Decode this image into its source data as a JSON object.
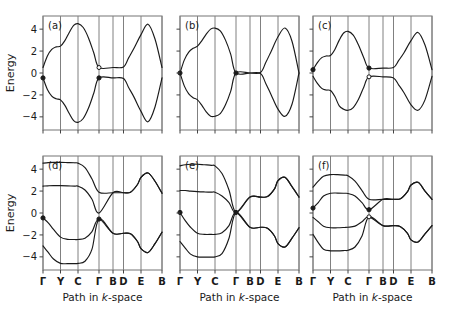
{
  "figure": {
    "type": "electronic band structure multi-panel figure",
    "panels_rows": 2,
    "panels_cols": 3,
    "background": "#ffffff",
    "line_color": "#1a1a1a",
    "grid_color": "#808080"
  },
  "axes": {
    "ylabel": "Energy",
    "xlabel_prefix": "Path in ",
    "xlabel_italic": "k",
    "xlabel_suffix": "-space",
    "xlabel_full": "Path in k-space",
    "yticks": [
      4,
      2,
      0,
      -2,
      -4
    ],
    "ytick_labels": [
      "4",
      "2",
      "0",
      "−2",
      "−4"
    ],
    "ylim": [
      -5.2,
      5.2
    ],
    "xtick_labels": [
      "Γ",
      "Y",
      "C",
      "Γ",
      "B",
      "D",
      "E",
      "B"
    ],
    "xtick_positions": [
      0,
      1,
      2,
      3.2,
      4.0,
      4.6,
      5.6,
      6.8
    ],
    "xlim": [
      0,
      6.8
    ]
  },
  "chart_data": {
    "type": "line",
    "title": "",
    "xlabel": "Path in k-space",
    "ylabel": "Energy",
    "ylim": [
      -5.2,
      5.2
    ],
    "grid": "vertical gridlines at each k-point label",
    "legend": "none",
    "panels": [
      {
        "tag": "(a)",
        "n_bands": 2,
        "gap_at_second_gamma": true,
        "markers": [
          {
            "x": 0.0,
            "y": -0.45,
            "style": "filled"
          },
          {
            "x": 3.2,
            "y": -0.45,
            "style": "filled"
          },
          {
            "x": 3.2,
            "y": 0.5,
            "style": "open"
          }
        ],
        "series": [
          {
            "name": "band-upper",
            "x": [
              0.0,
              0.25,
              0.5,
              0.75,
              1.0,
              1.25,
              1.5,
              1.75,
              2.0,
              2.3,
              2.6,
              2.9,
              3.2,
              4.0,
              4.6,
              4.9,
              5.2,
              5.6,
              6.0,
              6.4,
              6.8
            ],
            "y": [
              0.5,
              1.55,
              2.15,
              2.38,
              2.45,
              2.95,
              3.7,
              4.35,
              4.5,
              4.15,
              3.2,
              1.85,
              0.5,
              0.5,
              0.55,
              1.4,
              2.25,
              3.5,
              4.45,
              3.1,
              0.5
            ]
          },
          {
            "name": "band-lower",
            "x": [
              0.0,
              0.25,
              0.5,
              0.75,
              1.0,
              1.25,
              1.5,
              1.75,
              2.0,
              2.3,
              2.6,
              2.9,
              3.2,
              4.0,
              4.6,
              4.9,
              5.2,
              5.6,
              6.0,
              6.4,
              6.8
            ],
            "y": [
              -0.45,
              -1.5,
              -2.1,
              -2.35,
              -2.45,
              -2.95,
              -3.7,
              -4.35,
              -4.5,
              -4.15,
              -3.2,
              -1.85,
              -0.45,
              -0.45,
              -0.5,
              -1.35,
              -2.2,
              -3.5,
              -4.45,
              -3.1,
              -0.45
            ]
          }
        ]
      },
      {
        "tag": "(b)",
        "n_bands": 2,
        "gap_at_second_gamma": false,
        "markers": [
          {
            "x": 0.0,
            "y": 0.0,
            "style": "filled"
          },
          {
            "x": 3.2,
            "y": 0.0,
            "style": "filled"
          }
        ],
        "series": [
          {
            "name": "band-upper",
            "x": [
              0.0,
              0.25,
              0.5,
              0.75,
              1.0,
              1.25,
              1.5,
              1.75,
              2.0,
              2.3,
              2.6,
              2.9,
              3.2,
              4.0,
              4.6,
              4.9,
              5.2,
              5.6,
              6.0,
              6.4,
              6.8
            ],
            "y": [
              0.0,
              1.2,
              1.9,
              2.25,
              2.45,
              2.95,
              3.55,
              4.0,
              4.1,
              3.85,
              3.0,
              1.7,
              0.0,
              0.0,
              0.05,
              0.95,
              1.95,
              3.3,
              4.1,
              2.9,
              0.0
            ]
          },
          {
            "name": "band-lower",
            "x": [
              0.0,
              0.25,
              0.5,
              0.75,
              1.0,
              1.25,
              1.5,
              1.75,
              2.0,
              2.3,
              2.6,
              2.9,
              3.2,
              4.0,
              4.6,
              4.9,
              5.2,
              5.6,
              6.0,
              6.4,
              6.8
            ],
            "y": [
              0.0,
              -1.2,
              -1.9,
              -2.25,
              -2.45,
              -2.95,
              -3.55,
              -3.95,
              -3.95,
              -3.7,
              -2.9,
              -1.65,
              0.0,
              0.0,
              -0.05,
              -0.95,
              -1.95,
              -3.3,
              -3.95,
              -2.85,
              0.0
            ]
          }
        ]
      },
      {
        "tag": "(c)",
        "n_bands": 2,
        "gap_at_second_gamma": true,
        "markers": [
          {
            "x": 0.0,
            "y": 0.3,
            "style": "filled"
          },
          {
            "x": 3.2,
            "y": 0.45,
            "style": "filled"
          },
          {
            "x": 3.2,
            "y": -0.35,
            "style": "open"
          }
        ],
        "series": [
          {
            "name": "band-upper",
            "x": [
              0.0,
              0.25,
              0.5,
              0.75,
              1.0,
              1.25,
              1.5,
              1.75,
              2.0,
              2.3,
              2.6,
              2.9,
              3.2,
              4.0,
              4.6,
              4.9,
              5.2,
              5.6,
              6.0,
              6.4,
              6.8
            ],
            "y": [
              0.3,
              0.95,
              1.4,
              1.55,
              1.6,
              2.15,
              3.0,
              3.65,
              3.8,
              3.45,
              2.55,
              1.4,
              0.45,
              0.45,
              0.5,
              1.15,
              1.85,
              2.95,
              3.7,
              2.55,
              0.3
            ]
          },
          {
            "name": "band-lower",
            "x": [
              0.0,
              0.25,
              0.5,
              0.75,
              1.0,
              1.25,
              1.5,
              1.75,
              2.0,
              2.3,
              2.6,
              2.9,
              3.2,
              4.0,
              4.6,
              4.9,
              5.2,
              5.6,
              6.0,
              6.4,
              6.8
            ],
            "y": [
              -0.3,
              -0.95,
              -1.4,
              -1.55,
              -1.6,
              -2.15,
              -3.0,
              -3.3,
              -3.4,
              -3.15,
              -2.4,
              -1.3,
              -0.35,
              -0.35,
              -0.45,
              -1.1,
              -1.8,
              -2.9,
              -3.4,
              -2.45,
              -0.3
            ]
          }
        ]
      },
      {
        "tag": "(d)",
        "n_bands": 4,
        "gap_at_second_gamma": true,
        "markers": [
          {
            "x": 0.0,
            "y": -0.45,
            "style": "filled"
          },
          {
            "x": 3.2,
            "y": -0.55,
            "style": "filled"
          }
        ],
        "series": [
          {
            "name": "band-1",
            "x": [
              0.0,
              0.3,
              0.6,
              1.0,
              1.4,
              1.8,
              2.0,
              2.4,
              2.8,
              3.2,
              4.0,
              4.6,
              5.0,
              5.4,
              5.6,
              6.0,
              6.4,
              6.8
            ],
            "y": [
              4.55,
              4.6,
              4.62,
              4.62,
              4.6,
              4.58,
              4.55,
              4.15,
              3.1,
              1.9,
              1.85,
              1.85,
              1.9,
              2.6,
              3.25,
              3.65,
              2.9,
              1.8
            ]
          },
          {
            "name": "band-2",
            "x": [
              0.0,
              0.3,
              0.6,
              1.0,
              1.4,
              1.8,
              2.0,
              2.4,
              2.8,
              3.2,
              4.0,
              4.6,
              5.0,
              5.4,
              5.6,
              6.0,
              6.4,
              6.8
            ],
            "y": [
              2.45,
              2.48,
              2.5,
              2.5,
              2.48,
              2.45,
              2.45,
              2.1,
              1.25,
              0.0,
              1.85,
              1.85,
              1.9,
              2.6,
              3.25,
              3.65,
              2.9,
              1.8
            ]
          },
          {
            "name": "band-3",
            "x": [
              0.0,
              0.3,
              0.6,
              1.0,
              1.4,
              1.8,
              2.0,
              2.4,
              2.8,
              3.2,
              4.0,
              4.6,
              5.0,
              5.4,
              5.6,
              6.0,
              6.4,
              6.8
            ],
            "y": [
              -0.45,
              -0.9,
              -1.5,
              -2.2,
              -2.4,
              -2.42,
              -2.42,
              -2.3,
              -1.7,
              -0.55,
              -1.85,
              -1.85,
              -1.9,
              -2.6,
              -3.25,
              -3.6,
              -2.8,
              -1.75
            ]
          },
          {
            "name": "band-4",
            "x": [
              0.0,
              0.3,
              0.6,
              1.0,
              1.4,
              1.8,
              2.0,
              2.4,
              2.8,
              3.2,
              4.0,
              4.6,
              5.0,
              5.4,
              5.6,
              6.0,
              6.4,
              6.8
            ],
            "y": [
              -3.0,
              -3.6,
              -4.2,
              -4.6,
              -4.62,
              -4.62,
              -4.6,
              -4.4,
              -3.3,
              -0.55,
              -1.85,
              -1.85,
              -1.9,
              -2.6,
              -3.25,
              -3.6,
              -2.8,
              -1.75
            ]
          }
        ]
      },
      {
        "tag": "(e)",
        "n_bands": 4,
        "gap_at_second_gamma": true,
        "markers": [
          {
            "x": 0.0,
            "y": 0.05,
            "style": "filled"
          },
          {
            "x": 3.2,
            "y": 0.05,
            "style": "filled"
          }
        ],
        "series": [
          {
            "name": "band-1",
            "x": [
              0.0,
              0.3,
              0.6,
              1.0,
              1.4,
              1.8,
              2.0,
              2.4,
              2.8,
              3.2,
              4.0,
              4.6,
              5.0,
              5.4,
              5.6,
              6.0,
              6.4,
              6.8
            ],
            "y": [
              4.3,
              4.4,
              4.45,
              4.45,
              4.4,
              4.35,
              4.3,
              3.6,
              2.1,
              0.05,
              1.45,
              1.45,
              1.5,
              2.2,
              2.95,
              3.25,
              2.4,
              1.45
            ]
          },
          {
            "name": "band-2",
            "x": [
              0.0,
              0.3,
              0.6,
              1.0,
              1.4,
              1.8,
              2.0,
              2.4,
              2.8,
              3.2,
              4.0,
              4.6,
              5.0,
              5.4,
              5.6,
              6.0,
              6.4,
              6.8
            ],
            "y": [
              2.05,
              2.05,
              2.0,
              1.95,
              1.92,
              1.9,
              1.9,
              1.55,
              0.95,
              0.05,
              1.45,
              1.45,
              1.5,
              2.2,
              2.95,
              3.25,
              2.4,
              1.45
            ]
          },
          {
            "name": "band-3",
            "x": [
              0.0,
              0.3,
              0.6,
              1.0,
              1.4,
              1.8,
              2.0,
              2.4,
              2.8,
              3.2,
              4.0,
              4.6,
              5.0,
              5.4,
              5.6,
              6.0,
              6.4,
              6.8
            ],
            "y": [
              0.05,
              -0.7,
              -1.3,
              -1.85,
              -1.95,
              -1.95,
              -1.95,
              -1.8,
              -1.15,
              0.05,
              -1.3,
              -1.3,
              -1.4,
              -2.1,
              -2.8,
              -3.1,
              -2.3,
              -1.35
            ]
          },
          {
            "name": "band-4",
            "x": [
              0.0,
              0.3,
              0.6,
              1.0,
              1.4,
              1.8,
              2.0,
              2.4,
              2.8,
              3.2,
              4.0,
              4.6,
              5.0,
              5.4,
              5.6,
              6.0,
              6.4,
              6.8
            ],
            "y": [
              -2.6,
              -3.2,
              -3.75,
              -4.0,
              -4.02,
              -4.02,
              -4.0,
              -3.7,
              -2.3,
              0.05,
              -1.3,
              -1.3,
              -1.4,
              -2.1,
              -2.8,
              -3.1,
              -2.3,
              -1.35
            ]
          }
        ]
      },
      {
        "tag": "(f)",
        "n_bands": 4,
        "gap_at_second_gamma": true,
        "markers": [
          {
            "x": 0.0,
            "y": 0.45,
            "style": "filled"
          },
          {
            "x": 3.2,
            "y": 0.3,
            "style": "filled"
          },
          {
            "x": 3.2,
            "y": -0.35,
            "style": "open"
          }
        ],
        "series": [
          {
            "name": "band-1",
            "x": [
              0.0,
              0.3,
              0.6,
              1.0,
              1.4,
              1.8,
              2.0,
              2.4,
              2.8,
              3.2,
              4.0,
              4.6,
              5.0,
              5.4,
              5.6,
              6.0,
              6.4,
              6.8
            ],
            "y": [
              2.35,
              2.9,
              3.35,
              3.5,
              3.5,
              3.45,
              3.4,
              2.9,
              2.05,
              1.25,
              1.25,
              1.25,
              1.3,
              1.95,
              2.55,
              2.8,
              2.0,
              1.25
            ]
          },
          {
            "name": "band-2",
            "x": [
              0.0,
              0.3,
              0.6,
              1.0,
              1.4,
              1.8,
              2.0,
              2.4,
              2.8,
              3.2,
              4.0,
              4.6,
              5.0,
              5.4,
              5.6,
              6.0,
              6.4,
              6.8
            ],
            "y": [
              0.45,
              0.95,
              1.55,
              1.8,
              1.82,
              1.8,
              1.78,
              1.55,
              0.95,
              0.3,
              1.25,
              1.25,
              1.3,
              1.95,
              2.55,
              2.8,
              2.0,
              1.25
            ]
          },
          {
            "name": "band-3",
            "x": [
              0.0,
              0.3,
              0.6,
              1.0,
              1.4,
              1.8,
              2.0,
              2.4,
              2.8,
              3.2,
              4.0,
              4.6,
              5.0,
              5.4,
              5.6,
              6.0,
              6.4,
              6.8
            ],
            "y": [
              -0.4,
              -0.8,
              -1.2,
              -1.35,
              -1.35,
              -1.32,
              -1.3,
              -1.2,
              -0.8,
              -0.35,
              -1.15,
              -1.15,
              -1.25,
              -1.85,
              -2.45,
              -2.65,
              -1.9,
              -1.15
            ]
          },
          {
            "name": "band-4",
            "x": [
              0.0,
              0.3,
              0.6,
              1.0,
              1.4,
              1.8,
              2.0,
              2.4,
              2.8,
              3.2,
              4.0,
              4.6,
              5.0,
              5.4,
              5.6,
              6.0,
              6.4,
              6.8
            ],
            "y": [
              -1.95,
              -2.7,
              -3.3,
              -3.45,
              -3.45,
              -3.42,
              -3.4,
              -3.1,
              -2.1,
              -0.35,
              -1.15,
              -1.15,
              -1.25,
              -1.85,
              -2.45,
              -2.65,
              -1.9,
              -1.15
            ]
          }
        ]
      }
    ]
  }
}
